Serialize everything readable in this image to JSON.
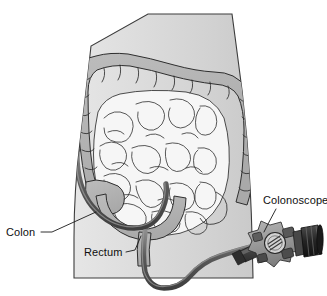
{
  "figure": {
    "width": 327,
    "height": 296,
    "background_color": "#ffffff"
  },
  "labels": [
    {
      "id": "colon",
      "text": "Colon",
      "x": 6,
      "y": 236,
      "anchor": "start",
      "leader": "M 41 232 L 52 232 L 96 212"
    },
    {
      "id": "rectum",
      "text": "Rectum",
      "x": 84,
      "y": 256,
      "anchor": "start",
      "leader": "M 126 252 L 135 250 L 141 236"
    },
    {
      "id": "colonoscope",
      "text": "Colonoscope",
      "x": 263,
      "y": 204,
      "anchor": "start",
      "leader": "M 276 209 L 268 224 L 264 232"
    }
  ],
  "colors": {
    "page_background": "#ffffff",
    "body_fill": "#d8d8d8",
    "body_fill_light": "#e4e4e4",
    "body_outline": "#3c3c3c",
    "colon_fill": "#b3b3b3",
    "colon_outline": "#2e2e2e",
    "small_intestine_fill": "#f4f4f4",
    "small_intestine_outline": "#2e2e2e",
    "scope_tube": "#555555",
    "scope_tube_highlight": "#8f8f8f",
    "scope_handle_dark": "#3a3a3a",
    "scope_handle_mid": "#6e6e6e",
    "scope_head_fill": "#9a9a9a",
    "scope_dial_fill": "#cfcfcf",
    "eyepiece_dark": "#2b2b2b",
    "label_text": "#0f0f0f",
    "leader_line": "#1a1a1a"
  },
  "anatomy": {
    "body_outline_path": "M 148 14 L 232 14 L 236 44 Q 243 92 247 140 Q 251 192 252 236 L 253 278 L 74 278 L 74 238 Q 74 190 80 142 Q 86 92 91 46 Z",
    "torso_parts": [
      {
        "id": "ascending-colon",
        "name": "Ascending colon"
      },
      {
        "id": "transverse-colon",
        "name": "Transverse colon"
      },
      {
        "id": "descending-colon",
        "name": "Descending colon"
      },
      {
        "id": "sigmoid-colon",
        "name": "Sigmoid colon"
      },
      {
        "id": "rectum",
        "name": "Rectum"
      },
      {
        "id": "small-intestine",
        "name": "Small intestine"
      }
    ]
  },
  "device": {
    "name": "Colonoscope",
    "parts": [
      {
        "id": "insertion-tube",
        "name": "Insertion tube"
      },
      {
        "id": "control-head",
        "name": "Control head"
      },
      {
        "id": "control-dial",
        "name": "Control dial"
      },
      {
        "id": "eyepiece",
        "name": "Eyepiece"
      }
    ]
  }
}
